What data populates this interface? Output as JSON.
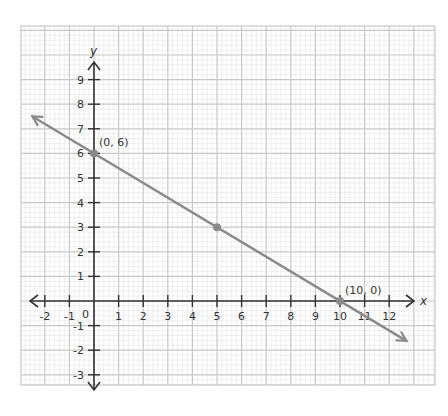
{
  "chart_data": {
    "type": "line",
    "title": "",
    "xlabel": "x",
    "ylabel": "y",
    "xlim": [
      -2.9,
      13.5
    ],
    "ylim": [
      -3.4,
      11
    ],
    "grid": true,
    "x_ticks": [
      -2,
      -1,
      1,
      2,
      3,
      4,
      5,
      6,
      7,
      8,
      9,
      10,
      11,
      12
    ],
    "x_tick_labels": [
      "-2",
      "-1",
      "1",
      "2",
      "3",
      "4",
      "5",
      "6",
      "7",
      "8",
      "9",
      "10",
      "11",
      "12"
    ],
    "y_ticks": [
      9,
      8,
      7,
      6,
      5,
      4,
      3,
      2,
      1,
      -1,
      -2,
      -3
    ],
    "y_tick_labels": [
      "9",
      "8",
      "7",
      "6",
      "5",
      "4",
      "3",
      "2",
      "1",
      "-1",
      "-2",
      "-3"
    ],
    "origin_label": "0",
    "series": [
      {
        "name": "line",
        "equation": "y = -0.6x + 6",
        "x": [
          -2.5,
          12.7
        ],
        "y": [
          7.5,
          -1.62
        ],
        "arrows_both_ends": true
      }
    ],
    "points": [
      {
        "x": 0,
        "y": 6,
        "label": "(0, 6)"
      },
      {
        "x": 5,
        "y": 3,
        "label": ""
      },
      {
        "x": 10,
        "y": 0,
        "label": "(10, 0)"
      }
    ]
  },
  "colors": {
    "grid_minor": "#e4e4e4",
    "grid_major": "#c8c8c8",
    "axis": "#333333",
    "line": "#8a8a8a",
    "point": "#8a8a8a"
  }
}
